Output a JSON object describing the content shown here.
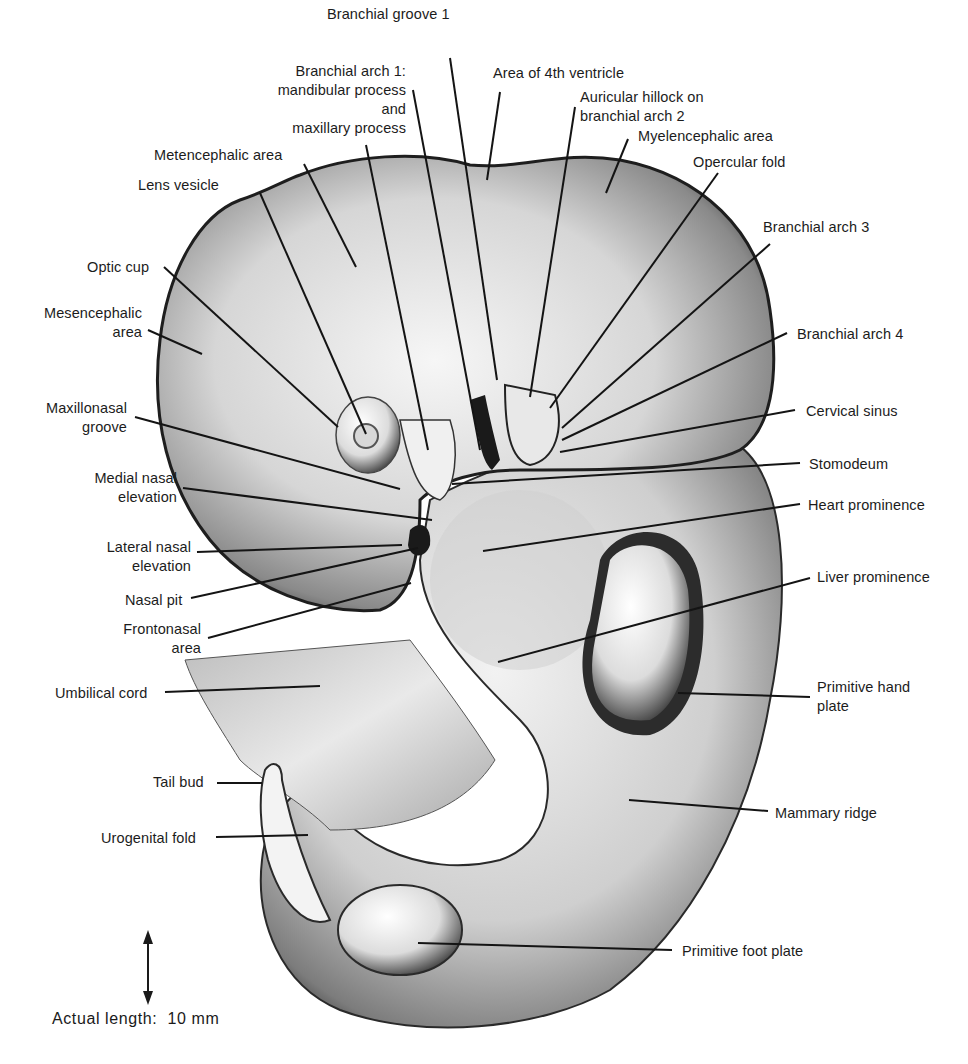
{
  "figure": {
    "scale": {
      "label": "Actual length:",
      "value": "10 mm"
    },
    "labels": [
      {
        "id": "branchial-groove-1",
        "text": "Branchial groove 1",
        "x": 327,
        "y": 5,
        "align": "left",
        "line": [
          [
            450,
            58
          ],
          [
            497,
            380
          ]
        ]
      },
      {
        "id": "branchial-arch-1",
        "text": "Branchial arch 1:\nmandibular process\nand\nmaxillary process",
        "x": 230,
        "y": 62,
        "align": "right",
        "box_w": 176,
        "line": [
          [
            413,
            90
          ],
          [
            480,
            450
          ]
        ],
        "line2": [
          [
            366,
            145
          ],
          [
            428,
            450
          ]
        ]
      },
      {
        "id": "area-4th-ventricle",
        "text": "Area of 4th ventricle",
        "x": 493,
        "y": 64,
        "align": "left",
        "line": [
          [
            500,
            92
          ],
          [
            487,
            180
          ]
        ]
      },
      {
        "id": "auricular-hillock",
        "text": "Auricular hillock on\nbranchial arch 2",
        "x": 580,
        "y": 88,
        "align": "left",
        "line": [
          [
            575,
            107
          ],
          [
            530,
            397
          ]
        ]
      },
      {
        "id": "myelencephalic-area",
        "text": "Myelencephalic area",
        "x": 638,
        "y": 127,
        "align": "left",
        "line": [
          [
            628,
            139
          ],
          [
            606,
            193
          ]
        ]
      },
      {
        "id": "metencephalic-area",
        "text": "Metencephalic area",
        "x": 154,
        "y": 146,
        "align": "left",
        "line": [
          [
            304,
            164
          ],
          [
            356,
            267
          ]
        ]
      },
      {
        "id": "opercular-fold",
        "text": "Opercular fold",
        "x": 693,
        "y": 153,
        "align": "left",
        "line": [
          [
            718,
            173
          ],
          [
            550,
            408
          ]
        ]
      },
      {
        "id": "lens-vesicle",
        "text": "Lens vesicle",
        "x": 138,
        "y": 176,
        "align": "left",
        "line": [
          [
            260,
            193
          ],
          [
            366,
            434
          ]
        ]
      },
      {
        "id": "branchial-arch-3",
        "text": "Branchial arch 3",
        "x": 763,
        "y": 218,
        "align": "left",
        "line": [
          [
            770,
            244
          ],
          [
            562,
            428
          ]
        ]
      },
      {
        "id": "optic-cup",
        "text": "Optic cup",
        "x": 87,
        "y": 258,
        "align": "left",
        "line": [
          [
            164,
            267
          ],
          [
            338,
            427
          ]
        ]
      },
      {
        "id": "mesencephalic-area",
        "text": "Mesencephalic\narea",
        "x": 32,
        "y": 304,
        "align": "right",
        "box_w": 110,
        "line": [
          [
            148,
            330
          ],
          [
            202,
            354
          ]
        ]
      },
      {
        "id": "branchial-arch-4",
        "text": "Branchial arch 4",
        "x": 797,
        "y": 325,
        "align": "left",
        "line": [
          [
            787,
            333
          ],
          [
            562,
            440
          ]
        ]
      },
      {
        "id": "maxillonasal-groove",
        "text": "Maxillonasal\ngroove",
        "x": 37,
        "y": 399,
        "align": "right",
        "box_w": 90,
        "line": [
          [
            135,
            417
          ],
          [
            400,
            489
          ]
        ]
      },
      {
        "id": "cervical-sinus",
        "text": "Cervical sinus",
        "x": 806,
        "y": 402,
        "align": "left",
        "line": [
          [
            795,
            410
          ],
          [
            560,
            452
          ]
        ]
      },
      {
        "id": "stomodeum",
        "text": "Stomodeum",
        "x": 809,
        "y": 455,
        "align": "left",
        "line": [
          [
            800,
            463
          ],
          [
            452,
            484
          ]
        ]
      },
      {
        "id": "medial-nasal-elevation",
        "text": "Medial nasal\nelevation",
        "x": 84,
        "y": 469,
        "align": "right",
        "box_w": 93,
        "line": [
          [
            183,
            488
          ],
          [
            432,
            520
          ]
        ]
      },
      {
        "id": "heart-prominence",
        "text": "Heart prominence",
        "x": 808,
        "y": 496,
        "align": "left",
        "line": [
          [
            800,
            504
          ],
          [
            483,
            551
          ]
        ]
      },
      {
        "id": "lateral-nasal-elevation",
        "text": "Lateral nasal\nelevation",
        "x": 98,
        "y": 538,
        "align": "right",
        "box_w": 93,
        "line": [
          [
            197,
            552
          ],
          [
            402,
            545
          ]
        ]
      },
      {
        "id": "nasal-pit",
        "text": "Nasal pit",
        "x": 125,
        "y": 591,
        "align": "left",
        "line": [
          [
            191,
            598
          ],
          [
            418,
            548
          ]
        ]
      },
      {
        "id": "liver-prominence",
        "text": "Liver prominence",
        "x": 817,
        "y": 568,
        "align": "left",
        "line": [
          [
            810,
            578
          ],
          [
            498,
            662
          ]
        ]
      },
      {
        "id": "frontonasal-area",
        "text": "Frontonasal\narea",
        "x": 115,
        "y": 620,
        "align": "right",
        "box_w": 86,
        "line": [
          [
            208,
            638
          ],
          [
            411,
            583
          ]
        ]
      },
      {
        "id": "umbilical-cord",
        "text": "Umbilical cord",
        "x": 55,
        "y": 684,
        "align": "left",
        "line": [
          [
            165,
            692
          ],
          [
            320,
            686
          ]
        ]
      },
      {
        "id": "primitive-hand-plate",
        "text": "Primitive hand\nplate",
        "x": 817,
        "y": 678,
        "align": "left",
        "line": [
          [
            810,
            697
          ],
          [
            678,
            693
          ]
        ]
      },
      {
        "id": "tail-bud",
        "text": "Tail bud",
        "x": 153,
        "y": 773,
        "align": "left",
        "line": [
          [
            217,
            783
          ],
          [
            262,
            783
          ]
        ]
      },
      {
        "id": "mammary-ridge",
        "text": "Mammary ridge",
        "x": 775,
        "y": 804,
        "align": "left",
        "line": [
          [
            768,
            811
          ],
          [
            629,
            800
          ]
        ]
      },
      {
        "id": "urogenital-fold",
        "text": "Urogenital fold",
        "x": 101,
        "y": 829,
        "align": "left",
        "line": [
          [
            216,
            837
          ],
          [
            308,
            835
          ]
        ]
      },
      {
        "id": "primitive-foot-plate",
        "text": "Primitive foot plate",
        "x": 682,
        "y": 942,
        "align": "left",
        "line": [
          [
            672,
            950
          ],
          [
            418,
            943
          ]
        ]
      }
    ]
  },
  "colors": {
    "background": "#ffffff",
    "text": "#1c1c1c",
    "leader_line": "#141414",
    "embryo_dark": "#2a2a2a",
    "embryo_mid": "#9a9a9a",
    "embryo_light": "#ececec"
  }
}
